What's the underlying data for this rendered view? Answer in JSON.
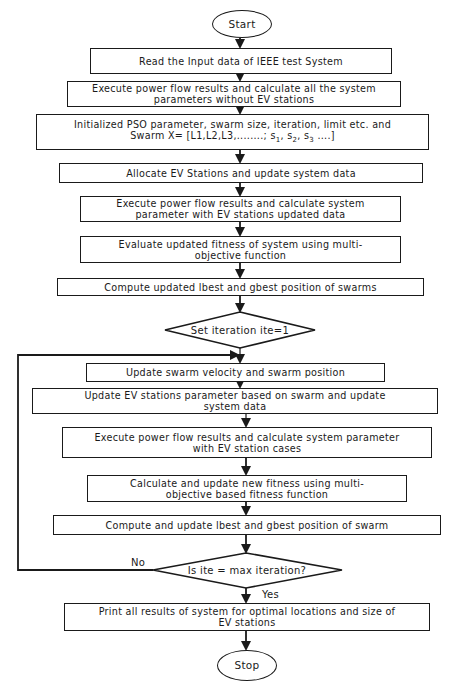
{
  "diagram": {
    "type": "flowchart",
    "nodes": {
      "start": {
        "shape": "terminator",
        "label": "Start"
      },
      "read_input": {
        "shape": "process",
        "label": "Read the Input data of IEEE test System"
      },
      "base_power_flow": {
        "shape": "process",
        "line1": "Execute power flow results and calculate all the system",
        "line2": "parameters without EV stations"
      },
      "init_pso": {
        "shape": "process",
        "line1": "Initialized PSO parameter, swarm size, iteration, limit etc. and",
        "line2_prefix": "Swarm X= [L1,L2,L3,........; s",
        "s1": "1",
        "s2": "2",
        "s3": "3",
        "line2_sep": ", s",
        "line2_suffix": " ....]"
      },
      "allocate_ev": {
        "shape": "process",
        "label": "Allocate EV Stations  and update system data"
      },
      "ev_power_flow": {
        "shape": "process",
        "line1": "Execute power flow results and calculate system",
        "line2": "parameter with EV stations updated data"
      },
      "evaluate_fitness": {
        "shape": "process",
        "line1": "Evaluate updated fitness of system using multi-",
        "line2": "objective function"
      },
      "compute_best": {
        "shape": "process",
        "label": "Compute updated lbest and gbest position of swarms"
      },
      "set_iteration": {
        "shape": "decision",
        "label": "Set iteration ite=1"
      },
      "update_velocity": {
        "shape": "process",
        "label": "Update swarm velocity and swarm position"
      },
      "update_ev_params": {
        "shape": "process",
        "line1": "Update EV stations parameter based on swarm and update",
        "line2": "system data"
      },
      "loop_power_flow": {
        "shape": "process",
        "line1": "Execute power flow results and calculate system parameter",
        "line2": "with EV station cases"
      },
      "new_fitness": {
        "shape": "process",
        "line1": "Calculate and update new fitness using multi-",
        "line2": "objective based fitness function"
      },
      "update_best": {
        "shape": "process",
        "label": "Compute and update lbest and gbest position of swarm"
      },
      "check_max": {
        "shape": "decision",
        "label": "Is ite = max iteration?"
      },
      "print_results": {
        "shape": "process",
        "line1": "Print all results of system for optimal locations and size of",
        "line2": "EV stations"
      },
      "stop": {
        "shape": "terminator",
        "label": "Stop"
      }
    },
    "edges": {
      "no_label": "No",
      "yes_label": "Yes"
    },
    "colors": {
      "stroke": "#1a1a1a",
      "background": "#ffffff"
    }
  }
}
